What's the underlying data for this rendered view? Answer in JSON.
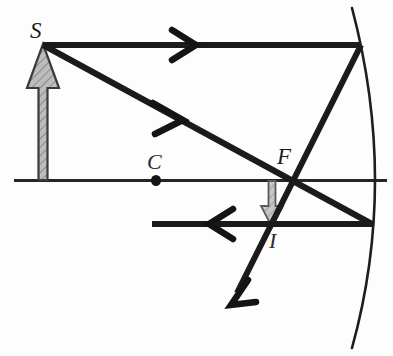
{
  "figure": {
    "background_color": "#fdfdfd",
    "ink_color": "#1b1b1b",
    "object_fill_color": "#b9b9b9",
    "image_fill_color": "#c0c0c0",
    "axis_color": "#232323",
    "mirror_color": "#1e1e1e",
    "width": 393,
    "height": 356
  },
  "labels": {
    "object": "S",
    "center_of_curvature": "C",
    "focal_point": "F",
    "image": "I"
  },
  "label_positions": {
    "object": {
      "x": 30,
      "y": 36
    },
    "center_of_curvature": {
      "x": 147,
      "y": 167
    },
    "focal_point": {
      "x": 277,
      "y": 162
    },
    "image": {
      "x": 269,
      "y": 247
    }
  },
  "geometry": {
    "principal_axis": {
      "x1": 14,
      "y1": 180,
      "x2": 387,
      "y2": 180
    },
    "mirror_arc": {
      "top_x": 352,
      "top_y": 8,
      "mid_x": 379,
      "mid_y": 182,
      "bottom_x": 352,
      "bottom_y": 348
    },
    "object_arrow": {
      "x": 43,
      "base_y": 180,
      "tip_y": 44
    },
    "image_arrow": {
      "x": 272,
      "base_y": 180,
      "tip_y": 226
    },
    "center_point": {
      "x": 156,
      "y": 180,
      "radius": 4.5
    },
    "parallel_incident_ray": {
      "x1": 43,
      "y1": 45,
      "x2": 361,
      "y2": 45,
      "arrow_x": 188
    },
    "reflected_through_focus_ray": {
      "x1": 361,
      "y1": 45,
      "x2": 232,
      "y2": 303
    },
    "ray_through_focus_incident": {
      "x1": 43,
      "y1": 45,
      "x2": 371,
      "y2": 224,
      "arrow_x": 178
    },
    "reflected_parallel_ray": {
      "x1": 371,
      "y1": 224,
      "x2": 152,
      "y2": 224,
      "arrow_x": 215
    }
  },
  "elements": [
    {
      "name": "object-arrow",
      "description": "Upright hatched gray arrow representing the object S"
    },
    {
      "name": "image-arrow",
      "description": "Inverted gray arrow representing the real image I"
    },
    {
      "name": "principal-axis",
      "description": "Horizontal optical axis line"
    },
    {
      "name": "concave-mirror-arc",
      "description": "Curved mirror surface at right"
    },
    {
      "name": "incident-parallel-ray",
      "description": "Ray from S parallel to axis striking the mirror"
    },
    {
      "name": "reflected-focus-ray",
      "description": "Reflected ray passing through focal point F"
    },
    {
      "name": "incident-focus-ray",
      "description": "Ray from S through focal point F to the mirror"
    },
    {
      "name": "reflected-parallel-ray",
      "description": "Reflected ray travelling parallel to axis leftwards"
    }
  ]
}
